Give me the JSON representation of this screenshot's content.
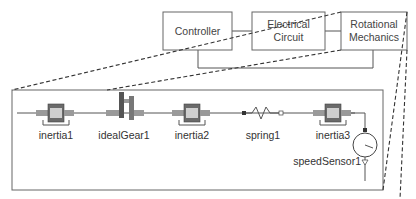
{
  "diagram": {
    "type": "hierarchical-model-block-diagram",
    "top_level": {
      "blocks": [
        {
          "id": "controller",
          "label_lines": [
            "Controller"
          ]
        },
        {
          "id": "electrical",
          "label_lines": [
            "Electrical",
            "Circuit"
          ]
        },
        {
          "id": "rotational",
          "label_lines": [
            "Rotational",
            "Mechanics"
          ]
        }
      ],
      "connections": [
        [
          "controller",
          "electrical"
        ],
        [
          "electrical",
          "rotational"
        ],
        [
          "controller",
          "rotational"
        ]
      ]
    },
    "detail": {
      "expands": "rotational",
      "components": [
        {
          "id": "inertia1",
          "label": "inertia1",
          "kind": "inertia"
        },
        {
          "id": "idealGear1",
          "label": "idealGear1",
          "kind": "ideal-gear"
        },
        {
          "id": "inertia2",
          "label": "inertia2",
          "kind": "inertia"
        },
        {
          "id": "spring1",
          "label": "spring1",
          "kind": "spring"
        },
        {
          "id": "inertia3",
          "label": "inertia3",
          "kind": "inertia"
        },
        {
          "id": "speedSensor1",
          "label": "speedSensor1",
          "kind": "speed-sensor"
        }
      ]
    }
  },
  "colors": {
    "line": "#555555",
    "box_border": "#666666",
    "text": "#333333",
    "inertia_body": "#6a6a6a",
    "shaft": "#9a9a9a"
  }
}
